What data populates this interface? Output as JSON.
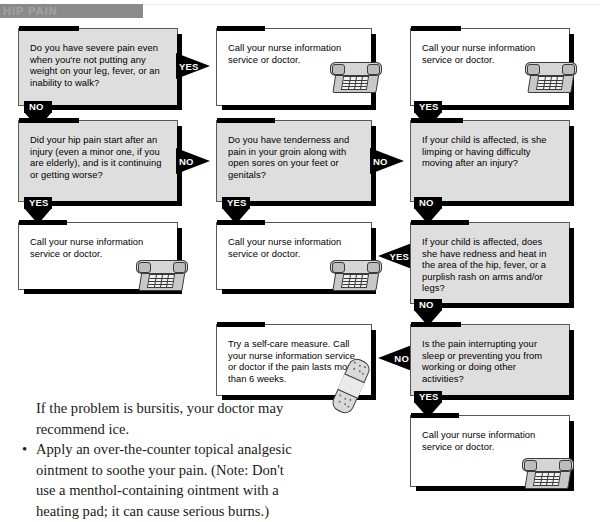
{
  "header": {
    "band_text": "HIP PAIN"
  },
  "flowchart": {
    "nodes": [
      {
        "id": "q1",
        "kind": "question",
        "text": "Do you have severe pain even when you're not putting any weight on your leg, fever, or an inability to walk?"
      },
      {
        "id": "a1",
        "kind": "action",
        "text": "Call your nurse information service or doctor."
      },
      {
        "id": "a2",
        "kind": "action",
        "text": "Call your nurse information service or doctor."
      },
      {
        "id": "q2",
        "kind": "question",
        "text": "Did your hip pain start after an injury (even a minor one, if you are elderly), and is it continuing or getting worse?"
      },
      {
        "id": "q3",
        "kind": "question",
        "text": "Do you have tenderness and pain in your groin along with open sores on your feet or genitals?"
      },
      {
        "id": "q4",
        "kind": "question",
        "text": "If your child is affected, is she limping or having difficulty moving after an injury?"
      },
      {
        "id": "a3",
        "kind": "action",
        "text": "Call your nurse information service or doctor."
      },
      {
        "id": "a4",
        "kind": "action",
        "text": "Call your nurse information service or doctor."
      },
      {
        "id": "q5",
        "kind": "question",
        "text": "If your child is affected, does she have redness and heat in the area of the hip, fever, or a purplish rash on arms and/or legs?"
      },
      {
        "id": "a5",
        "kind": "action",
        "text": "Try a self-care measure. Call your nurse information service or doctor if the pain lasts more than 6 weeks."
      },
      {
        "id": "q6",
        "kind": "question",
        "text": "Is the pain interrupting your sleep or preventing you from working or doing other activities?"
      },
      {
        "id": "a6",
        "kind": "action",
        "text": "Call your nurse information service or doctor."
      }
    ],
    "arrows": [
      {
        "id": "ar1",
        "label": "YES",
        "direction": "right"
      },
      {
        "id": "ar2",
        "label": "NO",
        "direction": "down"
      },
      {
        "id": "ar3",
        "label": "NO",
        "direction": "right"
      },
      {
        "id": "ar4",
        "label": "NO",
        "direction": "right"
      },
      {
        "id": "ar5",
        "label": "YES",
        "direction": "down"
      },
      {
        "id": "ar6",
        "label": "YES",
        "direction": "down"
      },
      {
        "id": "ar7",
        "label": "YES",
        "direction": "down"
      },
      {
        "id": "ar8",
        "label": "NO",
        "direction": "down"
      },
      {
        "id": "ar9",
        "label": "YES",
        "direction": "left"
      },
      {
        "id": "ar10",
        "label": "NO",
        "direction": "left"
      },
      {
        "id": "ar11",
        "label": "YES",
        "direction": "down"
      }
    ]
  },
  "body_copy": {
    "lines": [
      "If the problem is bursitis, your doctor may",
      "recommend ice."
    ],
    "bullet_glyph": "•",
    "bullet_lines": [
      "Apply an over-the-counter topical analgesic",
      "ointment to soothe your pain. (Note: Don't",
      "use a menthol-containing ointment with a",
      "heating pad; it can cause serious burns.)"
    ]
  }
}
